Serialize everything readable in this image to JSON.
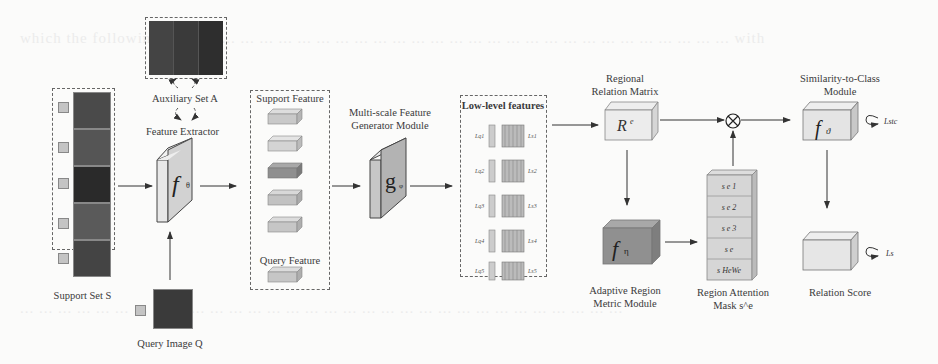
{
  "diagram": {
    "auxiliary_set": {
      "label": "Auxiliary Set A"
    },
    "feature_extractor": {
      "label": "Feature Extractor",
      "symbol": "f",
      "subscript": "θ"
    },
    "support_set": {
      "label": "Support Set S",
      "image_count": 5
    },
    "query_image": {
      "label": "Query Image Q"
    },
    "feature_panel": {
      "support_label": "Support Feature",
      "query_label": "Query Feature",
      "support_cubes": 5,
      "query_cubes": 1
    },
    "generator": {
      "label_line1": "Multi-scale Feature",
      "label_line2": "Generator Module",
      "symbol": "g",
      "subscript": "φ"
    },
    "low_level": {
      "label": "Low-level features",
      "left_labels": [
        "L^q1",
        "L^q2",
        "L^q3",
        "L^q4",
        "L^q5"
      ],
      "right_labels": [
        "L^s1",
        "L^s2",
        "L^s3",
        "L^s4",
        "L^s5"
      ]
    },
    "relation_matrix": {
      "label_line1": "Regional",
      "label_line2": "Relation Matrix",
      "symbol": "Re"
    },
    "multiply": {
      "symbol": "⊗"
    },
    "adaptive_region": {
      "label_line1": "Adaptive Region",
      "label_line2": "Metric Module",
      "symbol": "f",
      "subscript": "η"
    },
    "attention_mask": {
      "label_line1": "Region Attention",
      "label_line2": "Mask s^e",
      "cells": [
        "s^e 1",
        "s^e 2",
        "s^e 3",
        "s^e",
        "s^e HeWe"
      ]
    },
    "similarity": {
      "label_line1": "Similarity-to-Class",
      "label_line2": "Module",
      "symbol": "f",
      "subscript": "ϑ",
      "loss": "L_stc"
    },
    "relation_score": {
      "label": "Relation Score",
      "loss": "L_s"
    }
  },
  "colors": {
    "cube_light": "#e6e6e6",
    "cube_mid": "#c8c8c8",
    "cube_dark": "#8f8f8f",
    "line": "#333333",
    "dash": "#666666"
  }
}
